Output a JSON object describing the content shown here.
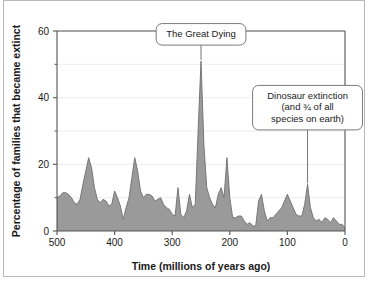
{
  "figure": {
    "background": "#ffffff",
    "border_color": "#b9b9b9"
  },
  "chart_data": {
    "type": "area",
    "title": "",
    "xlabel": "Time  (millions of years ago)",
    "ylabel": "Percentage of families that became extinct",
    "xlim": [
      500,
      0
    ],
    "ylim": [
      0,
      60
    ],
    "x_reversed": true,
    "grid": true,
    "grid_color": "#eeeeee",
    "area_fill": "#9a9a9a",
    "area_stroke": "#6e6e6e",
    "axis_color": "#555555",
    "xticks": [
      500,
      400,
      300,
      200,
      100,
      0
    ],
    "xtick_labels": [
      "500",
      "400",
      "300",
      "200",
      "100",
      "0"
    ],
    "yticks": [
      0,
      20,
      40,
      60
    ],
    "ytick_labels": [
      "0",
      "20",
      "40",
      "60"
    ],
    "yticks_minor": [
      10,
      30,
      50
    ],
    "x": [
      500,
      495,
      490,
      485,
      480,
      475,
      470,
      465,
      460,
      455,
      450,
      445,
      440,
      435,
      430,
      425,
      420,
      415,
      410,
      405,
      400,
      395,
      390,
      385,
      380,
      375,
      370,
      365,
      360,
      355,
      350,
      345,
      340,
      335,
      330,
      325,
      320,
      315,
      310,
      305,
      300,
      295,
      290,
      285,
      280,
      275,
      270,
      265,
      260,
      255,
      250,
      245,
      240,
      235,
      230,
      225,
      220,
      215,
      210,
      205,
      200,
      195,
      190,
      185,
      180,
      175,
      170,
      165,
      160,
      155,
      150,
      145,
      140,
      135,
      130,
      125,
      120,
      115,
      110,
      105,
      100,
      95,
      90,
      85,
      80,
      75,
      70,
      65,
      60,
      55,
      50,
      45,
      40,
      35,
      30,
      25,
      20,
      15,
      10,
      5,
      0
    ],
    "y": [
      10,
      10.5,
      11.5,
      11.5,
      11,
      10,
      8.5,
      8,
      9.5,
      14,
      18,
      22,
      19,
      13,
      9.5,
      8.5,
      9.5,
      9,
      7.5,
      8,
      12,
      10,
      7.5,
      3.5,
      7,
      10,
      16,
      22,
      18,
      12,
      10,
      11,
      11,
      10.5,
      9,
      9.5,
      10,
      8,
      7,
      6.5,
      5,
      4.5,
      13,
      5,
      4,
      6,
      11,
      7,
      8,
      30,
      51,
      26,
      13,
      10,
      8,
      7,
      11,
      13,
      10,
      22,
      10,
      4,
      4,
      4.5,
      4.5,
      3,
      2,
      2.5,
      1.5,
      1.5,
      9,
      11,
      6,
      3,
      4,
      4,
      5,
      6,
      7,
      9,
      11,
      9,
      7,
      5,
      4.5,
      4.5,
      8,
      14,
      7,
      4,
      3,
      3.5,
      2.5,
      4,
      3.5,
      2.5,
      4,
      3,
      2,
      2,
      1
    ],
    "annotations": [
      {
        "id": "great-dying",
        "lines": [
          "The Great Dying"
        ],
        "point_x": 250,
        "point_y": 51,
        "box_x": 250,
        "box_y": 59
      },
      {
        "id": "dinosaur-extinction",
        "lines": [
          "Dinosaur extinction",
          "(and ¾ of all",
          "species on earth)"
        ],
        "point_x": 65,
        "point_y": 14,
        "box_x": 65,
        "box_y": 37
      }
    ]
  }
}
